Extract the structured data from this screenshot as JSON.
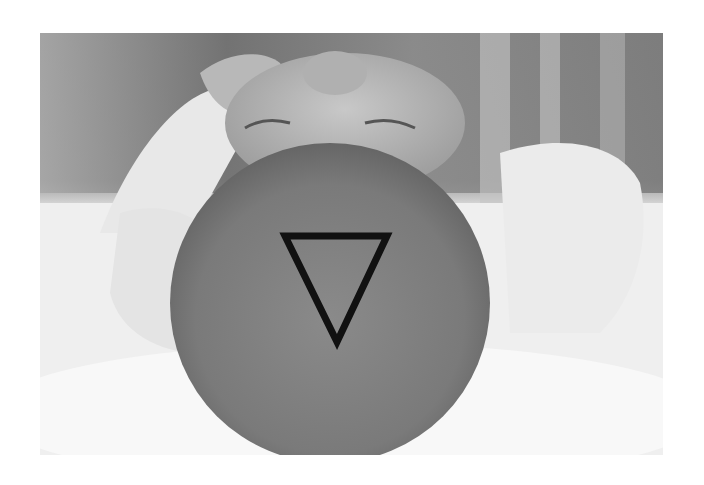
{
  "image": {
    "subject": "infant lying on back, top of head viewed from above",
    "style": "grayscale photograph",
    "annotation": {
      "shape": "downward-pointing triangle",
      "stroke_color": "#111111",
      "vertices": [
        [
          283,
          233
        ],
        [
          390,
          233
        ],
        [
          337,
          345
        ]
      ]
    }
  }
}
